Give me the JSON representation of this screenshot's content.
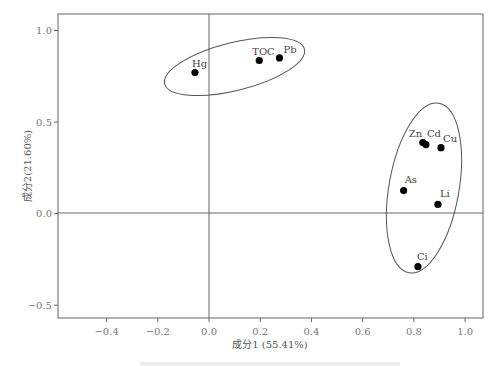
{
  "chart_data": {
    "type": "scatter",
    "title": "",
    "xlabel": "成分1 (55.41%)",
    "ylabel": "成分2(21.60%)",
    "xlim": [
      -0.59,
      1.07
    ],
    "ylim": [
      -0.57,
      1.09
    ],
    "xticks": [
      -0.4,
      -0.2,
      0.0,
      0.2,
      0.4,
      0.6,
      0.8,
      1.0
    ],
    "xtick_labels": [
      "−0.4",
      "−0.2",
      "0.0",
      "0.2",
      "0.4",
      "0.6",
      "0.8",
      "1.0"
    ],
    "yticks": [
      1.0,
      0.5,
      0.0,
      -0.5
    ],
    "ytick_labels": [
      "1.0",
      "0.5",
      "0.0",
      "−0.5"
    ],
    "grid": false,
    "reference_lines": {
      "x": 0.0,
      "y": 0.0
    },
    "points": [
      {
        "label": "Hg",
        "x": -0.055,
        "y": 0.77
      },
      {
        "label": "TOC",
        "x": 0.196,
        "y": 0.836
      },
      {
        "label": "Pb",
        "x": 0.275,
        "y": 0.85
      },
      {
        "label": "Zn",
        "x": 0.835,
        "y": 0.388
      },
      {
        "label": "Cd",
        "x": 0.847,
        "y": 0.377
      },
      {
        "label": "Cu",
        "x": 0.906,
        "y": 0.36
      },
      {
        "label": "As",
        "x": 0.76,
        "y": 0.126
      },
      {
        "label": "Li",
        "x": 0.894,
        "y": 0.05
      },
      {
        "label": "Ci",
        "x": 0.816,
        "y": -0.29
      }
    ],
    "groups": [
      {
        "name": "group-1",
        "members": [
          "Hg",
          "TOC",
          "Pb"
        ]
      },
      {
        "name": "group-2",
        "members": [
          "Zn",
          "Cd",
          "Cu",
          "As",
          "Li",
          "Ci"
        ]
      }
    ]
  }
}
